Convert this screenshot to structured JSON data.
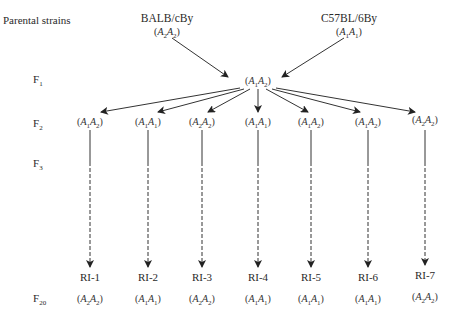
{
  "row_labels": {
    "parental": "Parental strains",
    "f1": "F",
    "f1_sub": "1",
    "f2": "F",
    "f2_sub": "2",
    "f3": "F",
    "f3_sub": "3",
    "f20": "F",
    "f20_sub": "20"
  },
  "parents": [
    {
      "name": "BALB/cBy",
      "allele1": "A",
      "sub1": "2",
      "allele2": "A",
      "sub2": "2"
    },
    {
      "name": "C57BL/6By",
      "allele1": "A",
      "sub1": "1",
      "allele2": "A",
      "sub2": "1"
    }
  ],
  "f1": {
    "allele1": "A",
    "sub1": "1",
    "allele2": "A",
    "sub2": "2"
  },
  "f2": [
    {
      "sub1": "1",
      "sub2": "2"
    },
    {
      "sub1": "1",
      "sub2": "1"
    },
    {
      "sub1": "2",
      "sub2": "2"
    },
    {
      "sub1": "1",
      "sub2": "1"
    },
    {
      "sub1": "1",
      "sub2": "2"
    },
    {
      "sub1": "1",
      "sub2": "2"
    },
    {
      "sub1": "2",
      "sub2": "2"
    }
  ],
  "ri_lines": [
    {
      "name": "RI-1",
      "sub1": "2",
      "sub2": "2"
    },
    {
      "name": "RI-2",
      "sub1": "1",
      "sub2": "1"
    },
    {
      "name": "RI-3",
      "sub1": "2",
      "sub2": "2"
    },
    {
      "name": "RI-4",
      "sub1": "1",
      "sub2": "1"
    },
    {
      "name": "RI-5",
      "sub1": "1",
      "sub2": "1"
    },
    {
      "name": "RI-6",
      "sub1": "1",
      "sub2": "1"
    },
    {
      "name": "RI-7",
      "sub1": "2",
      "sub2": "2"
    }
  ],
  "allele_symbol": "A",
  "colors": {
    "line": "#333333",
    "text": "#2a2a2a"
  }
}
